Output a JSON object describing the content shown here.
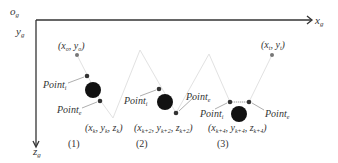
{
  "axes": {
    "origin": "o",
    "origin_sub": "g",
    "x": "x",
    "x_sub": "g",
    "y": "y",
    "y_sub": "g",
    "z": "z",
    "z_sub": "g"
  },
  "start_point": {
    "label": "(x",
    "sub1": "o",
    "mid": ", y",
    "sub2": "o",
    "end": ")"
  },
  "target_point": {
    "label": "(x",
    "sub1": "t",
    "mid": ", y",
    "sub2": "t",
    "end": ")"
  },
  "point_labels": {
    "entry": "Point",
    "entry_sub": "i",
    "exit": "Point",
    "exit_sub": "e"
  },
  "stages": [
    {
      "caption": "(1)",
      "coord": "(x",
      "c1": "k",
      "c2": ", y",
      "c3": "k",
      "c4": ", z",
      "c5": "k",
      "c6": ")"
    },
    {
      "caption": "(2)",
      "coord": "(x",
      "c1": "k+2",
      "c2": ", y",
      "c3": "k+2",
      "c4": ", z",
      "c5": "k+2",
      "c6": ")"
    },
    {
      "caption": "(3)",
      "coord": "(x",
      "c1": "k+4",
      "c2": ", y",
      "c3": "k+4",
      "c4": ", z",
      "c5": "k+4",
      "c6": ")"
    }
  ],
  "colors": {
    "axis": "#333333",
    "obstacle": "#111111",
    "path": "#dddddd",
    "arrow": "#999999"
  }
}
